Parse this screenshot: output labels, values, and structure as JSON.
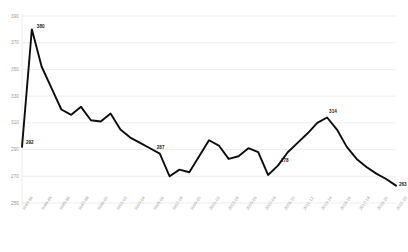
{
  "chart_data": {
    "type": "line",
    "title": "",
    "xlabel": "",
    "ylabel": "",
    "ylim": [
      250,
      390
    ],
    "y_ticks": [
      390,
      370,
      350,
      330,
      310,
      290,
      270,
      250
    ],
    "grid": true,
    "legend": "none",
    "line_color": "#0d0d0d",
    "grid_color": "#e8e8e8",
    "tick_text_color": "#9a9a9a",
    "label_text_color": "#1a1a1a",
    "categories": [
      "1983-84",
      "1984-85",
      "1985-86",
      "1986-87",
      "1987-88",
      "1988-89",
      "1989-90",
      "1990-91",
      "1991-92",
      "1992-93",
      "1993-94",
      "1994-95",
      "1995-96",
      "1996-97",
      "1997-98",
      "1998-99",
      "1999-00",
      "2000-01",
      "2001-02",
      "2002-03",
      "2003-04",
      "2004-05",
      "2005-06",
      "2006-07",
      "2007-08",
      "2008-09",
      "2009-10",
      "2010-11",
      "2011-12",
      "2012-13",
      "2013-14",
      "2014-15",
      "2015-16",
      "2016-17",
      "2017-18",
      "2018-19",
      "2019-20",
      "2020-21",
      "2021-22"
    ],
    "x_tick_labels": [
      "1983-84",
      "1984-85",
      "1985-86",
      "1987-88",
      "1989-90",
      "1991-92",
      "1993-94",
      "1995-96",
      "1997-98",
      "1999-00",
      "2001-02",
      "2003-04",
      "2005-06",
      "2007-08",
      "2009-10",
      "2011-12",
      "2013-14",
      "2015-16",
      "2017-18",
      "2019-20",
      "2021-22"
    ],
    "values": [
      292,
      380,
      352,
      336,
      320,
      316,
      322,
      312,
      311,
      317,
      305,
      299,
      295,
      291,
      287,
      270,
      275,
      273,
      285,
      297,
      293,
      283,
      285,
      291,
      288,
      271,
      278,
      288,
      295,
      302,
      310,
      314,
      305,
      292,
      283,
      277,
      272,
      268,
      263
    ],
    "annotated_points": [
      {
        "category": "1983-84",
        "value": 292,
        "label": "292"
      },
      {
        "category": "1984-85",
        "value": 380,
        "label": "380"
      },
      {
        "category": "1997-98",
        "value": 287,
        "label": "287"
      },
      {
        "category": "2009-10",
        "value": 278,
        "label": "278"
      },
      {
        "category": "2014-15",
        "value": 314,
        "label": "314"
      },
      {
        "category": "2021-22",
        "value": 263,
        "label": "263"
      }
    ]
  }
}
